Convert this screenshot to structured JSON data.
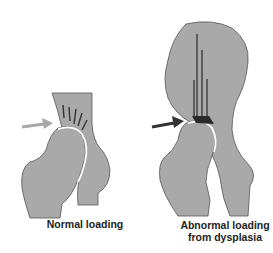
{
  "panels": [
    {
      "id": "normal",
      "label": "Normal loading",
      "arrow_color": "#a8a8a8",
      "load_lines": 5
    },
    {
      "id": "abnormal",
      "label_line1": "Abnormal loading",
      "label_line2": "from dysplasia",
      "arrow_color": "#333333",
      "load_lines": 4
    }
  ],
  "colors": {
    "bone_fill": "#a9a9a9",
    "bone_outline": "#444444",
    "load_line": "#333333",
    "background": "#ffffff"
  }
}
